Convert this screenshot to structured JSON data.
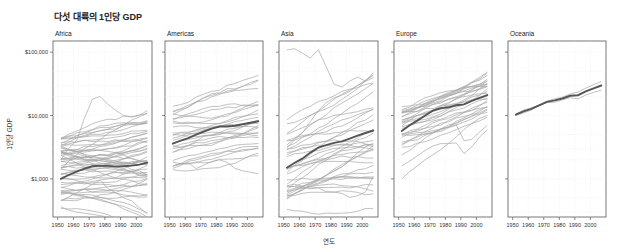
{
  "chart_data": {
    "type": "line",
    "title": "다섯 대륙의 1인당 GDP",
    "xlabel": "연도",
    "ylabel": "1인당 GDP",
    "yscale": "log",
    "ylim": [
      250,
      150000
    ],
    "xlim": [
      1947,
      2010
    ],
    "x_ticks": [
      1950,
      1960,
      1970,
      1980,
      1990,
      2000
    ],
    "x_tick_labels": [
      "1950",
      "1960",
      "1970",
      "1980",
      "1990",
      "2000"
    ],
    "y_ticks": [
      1000,
      10000,
      100000
    ],
    "y_tick_labels": [
      "$1,000",
      "$10,000",
      "$100,000"
    ],
    "grid": true,
    "legend": "none",
    "years": [
      1952,
      1957,
      1962,
      1967,
      1972,
      1977,
      1982,
      1987,
      1992,
      1997,
      2002,
      2007
    ],
    "colors": {
      "country_line": "#a8a8a8",
      "mean_line": "#555555",
      "frame": "#555555"
    },
    "panels": [
      {
        "name": "Africa",
        "mean": [
          1000,
          1150,
          1300,
          1450,
          1580,
          1620,
          1600,
          1560,
          1580,
          1620,
          1680,
          1800
        ],
        "country_count": 52,
        "country_start_range": [
          330,
          4500
        ],
        "country_growth_range": [
          0.3,
          3.0
        ],
        "outliers": [
          {
            "values": [
              2000,
              3000,
              4000,
              9000,
              18000,
              20000,
              15000,
              12000,
              10000,
              9500,
              10000,
              12000
            ]
          },
          {
            "values": [
              1400,
              1900,
              2400,
              3000,
              3500,
              4200,
              5200,
              6000,
              7000,
              8500,
              9500,
              11000
            ]
          },
          {
            "values": [
              450,
              520,
              600,
              700,
              820,
              950,
              700,
              600,
              500,
              450,
              350,
              280
            ]
          }
        ]
      },
      {
        "name": "Americas",
        "mean": [
          3600,
          4000,
          4400,
          5000,
          5600,
          6200,
          6700,
          6700,
          6900,
          7300,
          7700,
          8100
        ],
        "country_count": 25,
        "country_start_range": [
          1400,
          12000
        ],
        "country_growth_range": [
          1.0,
          3.2
        ],
        "outliers": [
          {
            "values": [
              13990,
              14850,
              16170,
              19530,
              21800,
              24070,
              25010,
              29880,
              32000,
              35770,
              39100,
              42950
            ]
          },
          {
            "values": [
              11370,
              12490,
              13460,
              16080,
              18970,
              22090,
              22900,
              26630,
              26340,
              28950,
              33330,
              36320
            ]
          },
          {
            "values": [
              1840,
              1730,
              1800,
              1450,
              1650,
              1870,
              2000,
              1820,
              1460,
              1340,
              1270,
              1200
            ]
          }
        ]
      },
      {
        "name": "Asia",
        "mean": [
          1500,
          1800,
          2100,
          2600,
          3100,
          3400,
          3700,
          3900,
          4300,
          4800,
          5300,
          5800
        ],
        "country_count": 33,
        "country_start_range": [
          330,
          9000
        ],
        "country_growth_range": [
          1.0,
          10.0
        ],
        "outliers": [
          {
            "values": [
              108380,
              113520,
              95460,
              80890,
              109350,
              59270,
              31350,
              28120,
              34930,
              40300,
              35110,
              47310
            ]
          },
          {
            "values": [
              780,
              820,
              760,
              700,
              720,
              630,
              620,
              590,
              510,
              540,
              620,
              1100
            ]
          },
          {
            "values": [
              3050,
              4170,
              5350,
              8000,
              12000,
              16000,
              19000,
              21000,
              24000,
              30000,
              36000,
              44000
            ]
          }
        ]
      },
      {
        "name": "Europe",
        "mean": [
          5700,
          7000,
          8300,
          10000,
          11900,
          13000,
          13500,
          14500,
          15000,
          17000,
          19000,
          21000
        ],
        "country_count": 27,
        "country_start_range": [
          3000,
          14700
        ],
        "country_growth_range": [
          2.2,
          4.5
        ],
        "outliers": [
          {
            "values": [
              1600,
              1900,
              2300,
              2800,
              3300,
              3600,
              3600,
              3700,
              2500,
              3200,
              4600,
              5900
            ]
          },
          {
            "values": [
              2400,
              2800,
              3500,
              4400,
              5300,
              5900,
              6600,
              7100,
              4000,
              4200,
              5500,
              7000
            ]
          },
          {
            "values": [
              1000,
              1300,
              1600,
              2000,
              2400,
              2900,
              3600,
              4600,
              6000,
              7500,
              9000,
              10000
            ]
          }
        ]
      },
      {
        "name": "Oceania",
        "mean": [
          10300,
          11600,
          12700,
          14500,
          16400,
          17300,
          18550,
          20450,
          20900,
          24000,
          26900,
          29800
        ],
        "country_count": 2,
        "series": [
          {
            "name": "Australia",
            "values": [
              10040,
              10950,
              12220,
              14530,
              16790,
              18330,
              19480,
              21890,
              23420,
              26990,
              30690,
              34440
            ]
          },
          {
            "name": "New Zealand",
            "values": [
              10560,
              12250,
              13180,
              14460,
              16050,
              16230,
              17630,
              19010,
              18360,
              21050,
              23190,
              25190
            ]
          }
        ]
      }
    ]
  }
}
